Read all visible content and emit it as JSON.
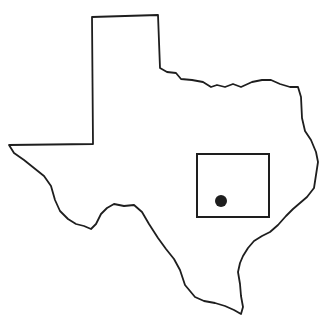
{
  "map": {
    "region": "Texas",
    "style": "outline",
    "outline_color": "#1e1e1e",
    "background": "#ffffff",
    "inset_box": {
      "x": 197,
      "y": 154,
      "width": 72,
      "height": 63,
      "label": ""
    },
    "marker": {
      "x": 221,
      "y": 201,
      "r": 6,
      "color": "#1e1e1e"
    }
  }
}
